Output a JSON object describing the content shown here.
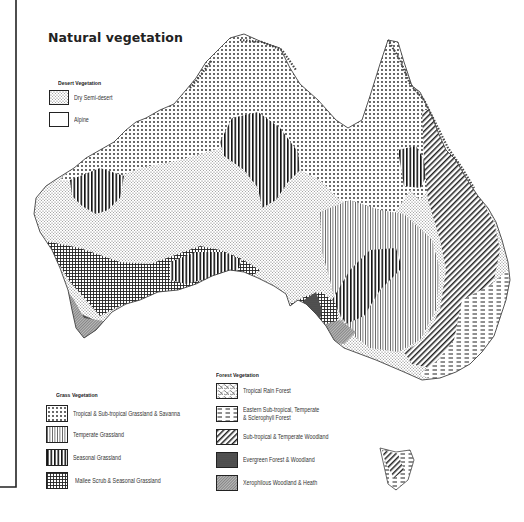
{
  "title": "Natural vegetation",
  "legend": {
    "desert": {
      "heading": "Desert Vegetation",
      "items": [
        {
          "label": "Dry Semi-desert",
          "pattern": "fine-dots"
        },
        {
          "label": "Alpine",
          "pattern": "blank"
        }
      ]
    },
    "grass": {
      "heading": "Grass Vegetation",
      "items": [
        {
          "label": "Tropical & Sub-tropical Grassland & Savanna",
          "pattern": "dots"
        },
        {
          "label": "Temperate Grassland",
          "pattern": "thin-vertical-lines"
        },
        {
          "label": "Seasonal Grassland",
          "pattern": "bold-vertical-lines"
        },
        {
          "label": "Mallee Scrub & Seasonal Grassland",
          "pattern": "grid"
        }
      ]
    },
    "forest": {
      "heading": "Forest Vegetation",
      "items": [
        {
          "label": "Tropical Rain Forest",
          "pattern": "scribble"
        },
        {
          "label_line1": "Eastern Sub-tropical, Temperate",
          "label_line2": "& Sclerophyll Forest",
          "pattern": "dashes"
        },
        {
          "label": "Sub-tropical & Temperate Woodland",
          "pattern": "diagonal-lines"
        },
        {
          "label": "Evergreen Forest & Woodland",
          "pattern": "dark-fill"
        },
        {
          "label": "Xerophilous Woodland & Heath",
          "pattern": "cross-hatch-fine"
        }
      ]
    }
  },
  "colors": {
    "ink": "#222222",
    "background": "#ffffff",
    "dark_fill": "#555555"
  }
}
